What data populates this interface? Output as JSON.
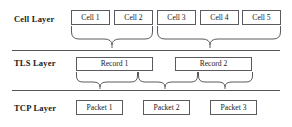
{
  "diagram": {
    "type": "layered-block-diagram",
    "width": 292,
    "height": 127,
    "colors": {
      "stroke": "#5a5a60",
      "divider": "#55555a",
      "text": "#18181c",
      "background": "#ffffff"
    },
    "layers": [
      {
        "id": "cell",
        "label": "Cell Layer",
        "label_x": 14,
        "label_y": 18,
        "units": [
          {
            "label": "Cell 1",
            "x": 71,
            "y": 10,
            "w": 39,
            "h": 15
          },
          {
            "label": "Cell 2",
            "x": 114,
            "y": 10,
            "w": 39,
            "h": 15
          },
          {
            "label": "Cell 3",
            "x": 157,
            "y": 10,
            "w": 39,
            "h": 15
          },
          {
            "label": "Cell 4",
            "x": 200,
            "y": 10,
            "w": 39,
            "h": 15
          },
          {
            "label": "Cell 5",
            "x": 242,
            "y": 10,
            "w": 39,
            "h": 15
          }
        ]
      },
      {
        "id": "tls",
        "label": "TLS Layer",
        "label_x": 14,
        "label_y": 62,
        "units": [
          {
            "label": "Record 1",
            "x": 76,
            "y": 57,
            "w": 77,
            "h": 14
          },
          {
            "label": "Record 2",
            "x": 175,
            "y": 57,
            "w": 77,
            "h": 14
          }
        ]
      },
      {
        "id": "tcp",
        "label": "TCP Layer",
        "label_x": 14,
        "label_y": 108,
        "units": [
          {
            "label": "Packet 1",
            "x": 76,
            "y": 100,
            "w": 47,
            "h": 15
          },
          {
            "label": "Packet 2",
            "x": 143,
            "y": 100,
            "w": 47,
            "h": 15
          },
          {
            "label": "Packet 3",
            "x": 210,
            "y": 100,
            "w": 47,
            "h": 15
          }
        ]
      }
    ],
    "dividers": [
      {
        "id": "divider-cell-tls",
        "x": 12,
        "y": 50,
        "w": 268
      },
      {
        "id": "divider-tls-tcp",
        "x": 12,
        "y": 90,
        "w": 268
      }
    ],
    "braces": [
      {
        "id": "brace-cells-1-2-to-record-1",
        "x": 71,
        "y": 26,
        "w": 82,
        "h": 22,
        "stem_ratio": 0.5,
        "from": [
          "Cell 1",
          "Cell 2"
        ],
        "to": "Record 1"
      },
      {
        "id": "brace-cells-3-5-to-record-2",
        "x": 157,
        "y": 26,
        "w": 124,
        "h": 22,
        "stem_ratio": 0.43,
        "from": [
          "Cell 3",
          "Cell 4",
          "Cell 5"
        ],
        "to": "Record 2"
      },
      {
        "id": "brace-record-1-left-to-packet-1",
        "x": 76,
        "y": 72,
        "w": 62,
        "h": 17,
        "stem_ratio": 0.38,
        "from": [
          "Record 1"
        ],
        "to": "Packet 1"
      },
      {
        "id": "brace-record-1-right-to-packet-2",
        "x": 138,
        "y": 72,
        "w": 60,
        "h": 17,
        "stem_ratio": 0.45,
        "from": [
          "Record 1",
          "Record 2"
        ],
        "to": "Packet 2"
      },
      {
        "id": "brace-record-2-right-to-packet-3",
        "x": 198,
        "y": 72,
        "w": 55,
        "h": 17,
        "stem_ratio": 0.5,
        "from": [
          "Record 2"
        ],
        "to": "Packet 3"
      }
    ]
  }
}
